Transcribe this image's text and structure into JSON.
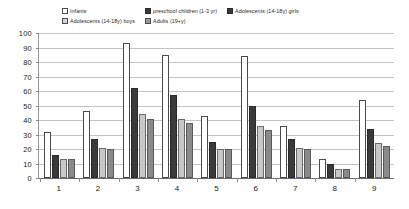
{
  "chart_data": {
    "type": "bar",
    "title": "",
    "subtitle": "",
    "xlabel": "",
    "ylabel": "",
    "ylim": [
      0,
      100
    ],
    "ytick_labels": [
      "100",
      "90",
      "80",
      "70",
      "60",
      "50",
      "40",
      "30",
      "20",
      "10",
      "0"
    ],
    "ytick_values": [
      100,
      90,
      80,
      70,
      60,
      50,
      40,
      30,
      20,
      10,
      0
    ],
    "categories": [
      "1",
      "2",
      "3",
      "4",
      "5",
      "6",
      "7",
      "8",
      "9"
    ],
    "grid": true,
    "legend_position": "top",
    "series": [
      {
        "name": "Infants",
        "color": "#ffffff",
        "border": "#4a4a4a",
        "values": [
          32,
          46,
          93,
          85,
          43,
          84,
          36,
          13,
          54
        ]
      },
      {
        "name": "preschool children (1-3 yr)",
        "color": "#3a3a3a",
        "border": "#2a2a2a",
        "values": [
          16,
          27,
          62,
          57,
          25,
          50,
          27,
          10,
          34
        ]
      },
      {
        "name": "Adolescents (14-18y) girls",
        "color": "#c8c8c8",
        "border": "#6a6a6a",
        "values": [
          13,
          21,
          44,
          41,
          20,
          36,
          21,
          6,
          24
        ]
      },
      {
        "name": "Adolescents (14-18y) boys",
        "color": "#8a8a8a",
        "border": "#5a5a5a",
        "values": [
          13,
          20,
          41,
          38,
          20,
          33,
          20,
          6,
          22
        ]
      }
    ]
  },
  "legend": {
    "columns": [
      {
        "items": [
          {
            "label": "Infants",
            "swatch": "#ffffff",
            "swatch_border": "#4a4a4a"
          },
          {
            "label": "Adolescents (14-18y) boys",
            "swatch": "#d8d8d8",
            "swatch_border": "#4a4a4a"
          }
        ]
      },
      {
        "items": [
          {
            "label": "preschool children (1-3 yr)",
            "swatch": "#3a3a3a",
            "swatch_border": "#2a2a2a"
          },
          {
            "label": "Adults (19+y)",
            "swatch": "#9a9a9a",
            "swatch_border": "#4a4a4a"
          }
        ]
      },
      {
        "items": [
          {
            "label": "Adolescents (14-18y)  girls",
            "swatch": "#3a3a3a",
            "swatch_border": "#2a2a2a"
          }
        ]
      }
    ]
  }
}
